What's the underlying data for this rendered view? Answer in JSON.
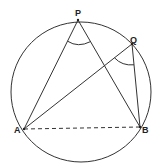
{
  "diagram": {
    "stroke_color": "#333333",
    "background": "#ffffff",
    "circle": {
      "cx": 81,
      "cy": 92,
      "r": 70
    },
    "points": {
      "P": {
        "label": "P",
        "x": 78,
        "y": 20
      },
      "Q": {
        "label": "Q",
        "x": 132,
        "y": 44
      },
      "A": {
        "label": "A",
        "x": 24,
        "y": 129
      },
      "B": {
        "label": "B",
        "x": 140,
        "y": 127
      }
    },
    "segments": [
      {
        "from": "P",
        "to": "A",
        "style": "solid"
      },
      {
        "from": "P",
        "to": "B",
        "style": "solid"
      },
      {
        "from": "Q",
        "to": "A",
        "style": "solid"
      },
      {
        "from": "Q",
        "to": "B",
        "style": "solid"
      },
      {
        "from": "A",
        "to": "B",
        "style": "dashed"
      }
    ],
    "angle_marks": [
      {
        "vertex": "P",
        "between": [
          "A",
          "B"
        ]
      },
      {
        "vertex": "Q",
        "between": [
          "A",
          "B"
        ]
      }
    ]
  }
}
